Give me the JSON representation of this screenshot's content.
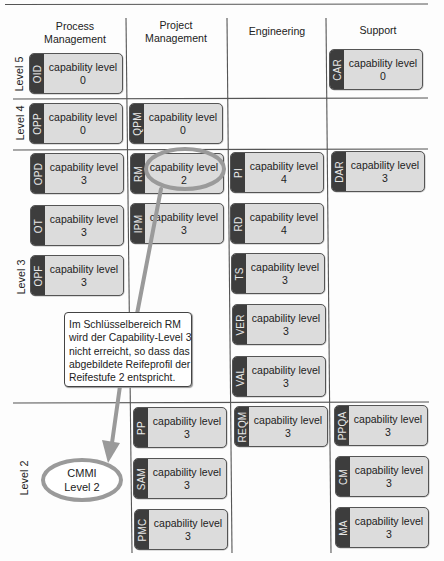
{
  "header": {
    "columns": [
      {
        "line1": "Process",
        "line2": "Management"
      },
      {
        "line1": "Project",
        "line2": "Management"
      },
      {
        "line1": "Engineering"
      },
      {
        "line1": "Support"
      }
    ]
  },
  "levels": [
    "Level 5",
    "Level 4",
    "Level 3",
    "Level 2"
  ],
  "process_areas": [
    {
      "abbr": "OID",
      "label": "capability level",
      "value": "0",
      "row": "Level 5",
      "column": "Process Management"
    },
    {
      "abbr": "CAR",
      "label": "capability level",
      "value": "0",
      "row": "Level 5",
      "column": "Support"
    },
    {
      "abbr": "OPP",
      "label": "capability level",
      "value": "0",
      "row": "Level 4",
      "column": "Process Management"
    },
    {
      "abbr": "QPM",
      "label": "capability level",
      "value": "0",
      "row": "Level 4",
      "column": "Project Management"
    },
    {
      "abbr": "OPD",
      "label": "capability level",
      "value": "3",
      "row": "Level 3",
      "column": "Process Management"
    },
    {
      "abbr": "OT",
      "label": "capability level",
      "value": "3",
      "row": "Level 3",
      "column": "Process Management"
    },
    {
      "abbr": "OPF",
      "label": "capability level",
      "value": "3",
      "row": "Level 3",
      "column": "Process Management"
    },
    {
      "abbr": "RM",
      "label": "capability level",
      "value": "2",
      "row": "Level 3",
      "column": "Project Management"
    },
    {
      "abbr": "IPM",
      "label": "capability level",
      "value": "3",
      "row": "Level 3",
      "column": "Project Management"
    },
    {
      "abbr": "PI",
      "label": "capability level",
      "value": "4",
      "row": "Level 3",
      "column": "Engineering"
    },
    {
      "abbr": "RD",
      "label": "capability level",
      "value": "4",
      "row": "Level 3",
      "column": "Engineering"
    },
    {
      "abbr": "TS",
      "label": "capability level",
      "value": "3",
      "row": "Level 3",
      "column": "Engineering"
    },
    {
      "abbr": "VER",
      "label": "capability level",
      "value": "3",
      "row": "Level 3",
      "column": "Engineering"
    },
    {
      "abbr": "VAL",
      "label": "capability level",
      "value": "3",
      "row": "Level 3",
      "column": "Engineering"
    },
    {
      "abbr": "DAR",
      "label": "capability level",
      "value": "3",
      "row": "Level 3",
      "column": "Support"
    },
    {
      "abbr": "PP",
      "label": "capability level",
      "value": "3",
      "row": "Level 2",
      "column": "Project Management"
    },
    {
      "abbr": "SAM",
      "label": "capability level",
      "value": "3",
      "row": "Level 2",
      "column": "Project Management"
    },
    {
      "abbr": "PMC",
      "label": "capability level",
      "value": "3",
      "row": "Level 2",
      "column": "Project Management"
    },
    {
      "abbr": "REQM",
      "label": "capability level",
      "value": "3",
      "row": "Level 2",
      "column": "Engineering"
    },
    {
      "abbr": "PPQA",
      "label": "capability level",
      "value": "3",
      "row": "Level 2",
      "column": "Support"
    },
    {
      "abbr": "CM",
      "label": "capability level",
      "value": "3",
      "row": "Level 2",
      "column": "Support"
    },
    {
      "abbr": "MA",
      "label": "capability level",
      "value": "3",
      "row": "Level 2",
      "column": "Support"
    }
  ],
  "annotation": {
    "callout_lines": [
      "Im Schlüsselbereich RM",
      "wird der Capability-Level 3",
      "nicht erreicht, so dass das",
      "abgebildete Reifeprofil der",
      "Reifestufe 2 entspricht."
    ],
    "badge_lines": [
      "CMMI",
      "Level 2"
    ]
  },
  "colors": {
    "grid_line": "#555555",
    "box_fill": "#dcdcdc",
    "box_strip": "#3d3d3d",
    "highlight": "#9a9a9a"
  }
}
